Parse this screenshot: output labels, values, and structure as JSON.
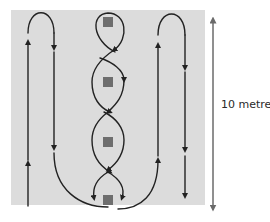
{
  "diagram": {
    "scale": {
      "label": "10 metres",
      "direction": "vertical"
    },
    "colors": {
      "area_background": "#dcdcdc",
      "path_stroke": "#222222",
      "obstacle_fill": "#6e6e6e",
      "scale_stroke": "#6a6a6a"
    },
    "obstacles": [
      {
        "id": 1,
        "label": ""
      },
      {
        "id": 2,
        "label": ""
      },
      {
        "id": 3,
        "label": ""
      },
      {
        "id": 4,
        "label": ""
      }
    ],
    "paths": [
      {
        "name": "left-loop",
        "shape": "hairpin",
        "direction": "up left side, down right side"
      },
      {
        "name": "center-weave",
        "shape": "figure-eight chain around obstacles"
      },
      {
        "name": "right-loop",
        "shape": "hairpin",
        "direction": "up left side, down right side"
      },
      {
        "name": "bottom-connector",
        "shape": "curve joining left loop to right loop under bottom obstacle"
      }
    ]
  }
}
